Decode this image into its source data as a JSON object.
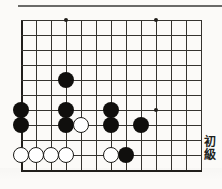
{
  "page": {
    "kind": "go-problem-diagram",
    "background_color": "#fbfaf8",
    "width": 222,
    "height": 189
  },
  "top_rule": {
    "color": "#6a6a68"
  },
  "side_label": {
    "text_line_1": "初",
    "text_line_2": "級",
    "full_text": "初級",
    "color": "#211f1c"
  },
  "board": {
    "line_color": "#35332f",
    "edge_color": "#201e1b",
    "origin_x": 21,
    "origin_y": 10,
    "cell": 15,
    "cols": 13,
    "rows": 11,
    "edges": {
      "left": true,
      "bottom": true,
      "top": false,
      "right": false
    },
    "star_points": [
      {
        "col": 3,
        "row": 0
      },
      {
        "col": 9,
        "row": 0
      },
      {
        "col": 9,
        "row": 6
      }
    ],
    "stones": [
      {
        "color": "black",
        "col": 3,
        "row": 4
      },
      {
        "color": "black",
        "col": 0,
        "row": 6
      },
      {
        "color": "black",
        "col": 3,
        "row": 6
      },
      {
        "color": "black",
        "col": 6,
        "row": 6
      },
      {
        "color": "black",
        "col": 0,
        "row": 7
      },
      {
        "color": "black",
        "col": 3,
        "row": 7
      },
      {
        "color": "black",
        "col": 6,
        "row": 7
      },
      {
        "color": "black",
        "col": 8,
        "row": 7
      },
      {
        "color": "black",
        "col": 7,
        "row": 9
      },
      {
        "color": "white",
        "col": 4,
        "row": 7
      },
      {
        "color": "white",
        "col": 0,
        "row": 9
      },
      {
        "color": "white",
        "col": 1,
        "row": 9
      },
      {
        "color": "white",
        "col": 2,
        "row": 9
      },
      {
        "color": "white",
        "col": 3,
        "row": 9
      },
      {
        "color": "white",
        "col": 6,
        "row": 9
      }
    ],
    "stone_colors": {
      "black": "#100f0d",
      "white": "#ffffff",
      "white_border": "#1a1916"
    }
  }
}
